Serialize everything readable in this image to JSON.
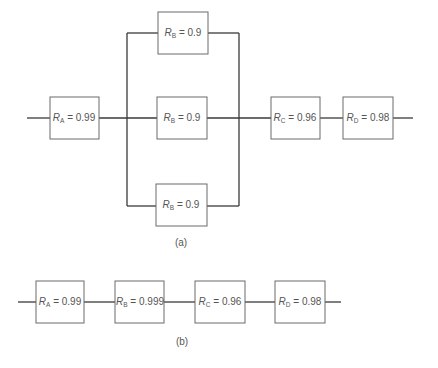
{
  "diagram": {
    "part_a": {
      "caption": "(a)",
      "blocks": [
        {
          "id": "A",
          "symbol": "R",
          "sub": "A",
          "eq": " = 0.99",
          "x": 50,
          "y": 97,
          "w": 49,
          "h": 42
        },
        {
          "id": "B1",
          "symbol": "R",
          "sub": "B",
          "eq": " = 0.9",
          "x": 158,
          "y": 12,
          "w": 50,
          "h": 42
        },
        {
          "id": "B2",
          "symbol": "R",
          "sub": "B",
          "eq": " = 0.9",
          "x": 157,
          "y": 97,
          "w": 50,
          "h": 42
        },
        {
          "id": "B3",
          "symbol": "R",
          "sub": "B",
          "eq": " = 0.9",
          "x": 156,
          "y": 184,
          "w": 51,
          "h": 42
        },
        {
          "id": "C",
          "symbol": "R",
          "sub": "C",
          "eq": " = 0.96",
          "x": 271,
          "y": 97,
          "w": 49,
          "h": 42
        },
        {
          "id": "D",
          "symbol": "R",
          "sub": "D",
          "eq": " = 0.98",
          "x": 343,
          "y": 97,
          "w": 50,
          "h": 42
        }
      ],
      "structure": "A in series with (B || B || B) in series with C in series with D"
    },
    "part_b": {
      "caption": "(b)",
      "blocks": [
        {
          "id": "A",
          "symbol": "R",
          "sub": "A",
          "eq": " = 0.99",
          "x": 36,
          "y": 281,
          "w": 48,
          "h": 42
        },
        {
          "id": "B",
          "symbol": "R",
          "sub": "B",
          "eq": " = 0.999",
          "x": 115,
          "y": 281,
          "w": 49,
          "h": 42
        },
        {
          "id": "C",
          "symbol": "R",
          "sub": "C",
          "eq": " = 0.96",
          "x": 195,
          "y": 281,
          "w": 50,
          "h": 42
        },
        {
          "id": "D",
          "symbol": "R",
          "sub": "D",
          "eq": " = 0.98",
          "x": 275,
          "y": 281,
          "w": 50,
          "h": 42
        }
      ],
      "structure": "A in series with B in series with C in series with D"
    }
  },
  "labels": {
    "a_A": {
      "sym": "R",
      "sub": "A",
      "eq": " = 0.99"
    },
    "a_B1": {
      "sym": "R",
      "sub": "B",
      "eq": " = 0.9"
    },
    "a_B2": {
      "sym": "R",
      "sub": "B",
      "eq": " = 0.9"
    },
    "a_B3": {
      "sym": "R",
      "sub": "B",
      "eq": " = 0.9"
    },
    "a_C": {
      "sym": "R",
      "sub": "C",
      "eq": " = 0.96"
    },
    "a_D": {
      "sym": "R",
      "sub": "D",
      "eq": " = 0.98"
    },
    "b_A": {
      "sym": "R",
      "sub": "A",
      "eq": " = 0.99"
    },
    "b_B": {
      "sym": "R",
      "sub": "B",
      "eq": " = 0.999"
    },
    "b_C": {
      "sym": "R",
      "sub": "C",
      "eq": " = 0.96"
    },
    "b_D": {
      "sym": "R",
      "sub": "D",
      "eq": " = 0.98"
    },
    "caption_a": "(a)",
    "caption_b": "(b)"
  }
}
